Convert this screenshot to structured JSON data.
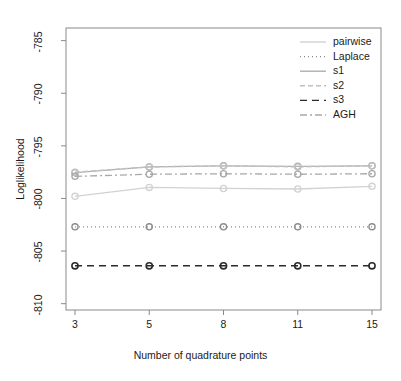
{
  "figure": {
    "width": 401,
    "height": 381,
    "background": "#ffffff"
  },
  "chart_data": {
    "type": "line",
    "title": "",
    "xlabel": "Number of quadrature points",
    "ylabel": "Loglikelihood",
    "categories": [
      "3",
      "5",
      "8",
      "11",
      "15"
    ],
    "x": [
      3,
      5,
      8,
      11,
      15
    ],
    "xtick_labels": [
      "3",
      "5",
      "8",
      "11",
      "15"
    ],
    "ytick_labels": [
      "-785",
      "-790",
      "-795",
      "-800",
      "-805",
      "-810"
    ],
    "ytick_values": [
      -785,
      -790,
      -795,
      -800,
      -805,
      -810
    ],
    "ylim": [
      -810.6,
      -783.8
    ],
    "grid": false,
    "legend_position": "top-right",
    "marker": "circle-open",
    "series": [
      {
        "name": "pairwise",
        "values": [
          -799.8,
          -798.95,
          -799.05,
          -799.1,
          -798.85
        ],
        "color": "#d2d2d2",
        "dash": "none",
        "width": 1.3
      },
      {
        "name": "Laplace",
        "values": [
          -802.7,
          -802.7,
          -802.7,
          -802.7,
          -802.7
        ],
        "color": "#8c8c8c",
        "dash": "1,3",
        "width": 1.3
      },
      {
        "name": "s1",
        "values": [
          -797.55,
          -797.0,
          -796.9,
          -796.95,
          -796.9
        ],
        "color": "#aeaeae",
        "dash": "none",
        "width": 1.3
      },
      {
        "name": "s2",
        "values": [
          -797.5,
          -797.0,
          -796.9,
          -797.0,
          -796.9
        ],
        "color": "#c0c0c0",
        "dash": "5,3",
        "width": 1.3
      },
      {
        "name": "s3",
        "values": [
          -806.4,
          -806.4,
          -806.4,
          -806.4,
          -806.4
        ],
        "color": "#2b2b2b",
        "dash": "7,5",
        "width": 1.6
      },
      {
        "name": "AGH",
        "values": [
          -797.9,
          -797.7,
          -797.65,
          -797.7,
          -797.65
        ],
        "color": "#a8a8a8",
        "dash": "7,3,2,3",
        "width": 1.3
      }
    ],
    "legend_entries": [
      {
        "label": "pairwise",
        "color": "#d2d2d2",
        "dash": "none"
      },
      {
        "label": "Laplace",
        "color": "#8c8c8c",
        "dash": "1,3"
      },
      {
        "label": "s1",
        "color": "#aeaeae",
        "dash": "none"
      },
      {
        "label": "s2",
        "color": "#c0c0c0",
        "dash": "5,3"
      },
      {
        "label": "s3",
        "color": "#2b2b2b",
        "dash": "7,5"
      },
      {
        "label": "AGH",
        "color": "#a8a8a8",
        "dash": "7,3,2,3"
      }
    ]
  },
  "axes": {
    "frame_color": "#8a8a8a",
    "text_color": "#1a1a1a"
  }
}
